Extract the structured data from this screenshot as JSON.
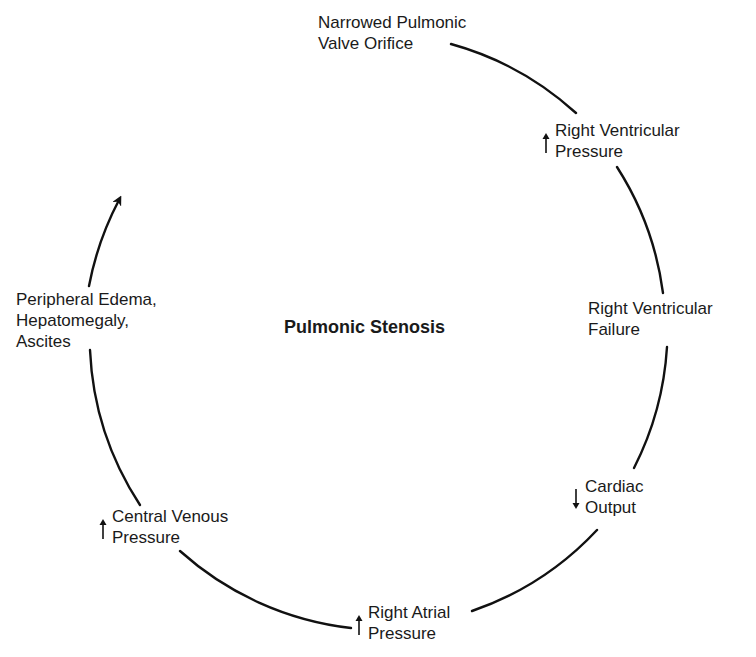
{
  "diagram": {
    "type": "cycle",
    "title": "Pulmonic Stenosis",
    "colors": {
      "background": "#ffffff",
      "stroke": "#111111",
      "text": "#1a1a1a"
    },
    "nodes": [
      {
        "id": "narrowed-valve",
        "indicator": "none",
        "lines": [
          "Narrowed Pulmonic",
          "Valve Orifice"
        ]
      },
      {
        "id": "rv-pressure",
        "indicator": "up-arrow",
        "lines": [
          "Right Ventricular",
          "Pressure"
        ]
      },
      {
        "id": "rv-failure",
        "indicator": "none",
        "lines": [
          "Right Ventricular",
          "Failure"
        ]
      },
      {
        "id": "cardiac-output",
        "indicator": "down-arrow",
        "lines": [
          "Cardiac",
          "Output"
        ]
      },
      {
        "id": "ra-pressure",
        "indicator": "up-arrow",
        "lines": [
          "Right Atrial",
          "Pressure"
        ]
      },
      {
        "id": "cv-pressure",
        "indicator": "up-arrow",
        "lines": [
          "Central Venous",
          "Pressure"
        ]
      },
      {
        "id": "peripheral-edema",
        "indicator": "none",
        "lines": [
          "Peripheral Edema,",
          "Hepatomegaly,",
          "Ascites"
        ]
      }
    ],
    "flow": "clockwise; arrowhead at upper-left pointing back toward top (cycle continues)"
  }
}
